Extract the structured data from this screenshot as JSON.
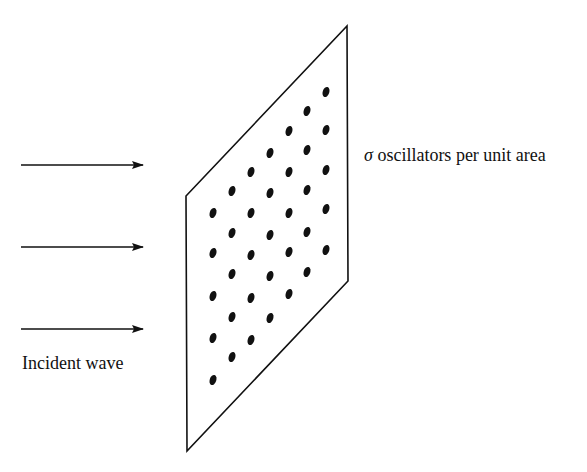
{
  "labels": {
    "sheet_symbol": "σ",
    "sheet_text": " oscillators per unit area",
    "incident": "Incident wave"
  },
  "colors": {
    "stroke": "#111111",
    "background": "#ffffff"
  },
  "sheet": {
    "points": "347,26 348,281 187,451 186,196"
  },
  "arrows": [
    {
      "x1": 21,
      "x2": 143,
      "y": 165
    },
    {
      "x1": 21,
      "x2": 143,
      "y": 247
    },
    {
      "x1": 21,
      "x2": 143,
      "y": 329
    }
  ],
  "dot_columns": [
    {
      "x": 213,
      "ys": [
        213,
        253,
        296,
        338,
        380
      ]
    },
    {
      "x": 232,
      "ys": [
        191,
        233,
        274,
        317,
        357
      ]
    },
    {
      "x": 251,
      "ys": [
        172,
        213,
        255,
        298,
        340
      ]
    },
    {
      "x": 270,
      "ys": [
        153,
        193,
        235,
        276,
        318
      ]
    },
    {
      "x": 289,
      "ys": [
        131,
        172,
        213,
        252,
        294
      ]
    },
    {
      "x": 307,
      "ys": [
        111,
        150,
        190,
        232,
        272
      ]
    },
    {
      "x": 326,
      "ys": [
        92,
        130,
        170,
        209,
        250
      ]
    }
  ]
}
